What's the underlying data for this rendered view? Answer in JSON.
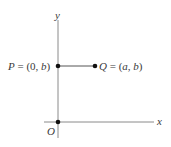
{
  "diagram": {
    "axes": {
      "x_label": "x",
      "y_label": "y",
      "origin_label": "O"
    },
    "points": [
      {
        "name": "P",
        "label": "P = (0, b)",
        "name_part": "P",
        "eq_part": " = (0, ",
        "var_part": "b",
        "close_part": ")"
      },
      {
        "name": "Q",
        "label": "Q = (a, b)",
        "name_part": "Q",
        "eq_part": " = (",
        "var1": "a",
        "sep": ", ",
        "var2": "b",
        "close_part": ")"
      }
    ],
    "segment": {
      "from": "P",
      "to": "Q"
    },
    "colors": {
      "axis": "#8a8a8a",
      "segment": "#555555",
      "point": "#111111",
      "text": "#3a3a3a"
    }
  }
}
